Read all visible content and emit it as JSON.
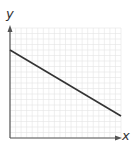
{
  "chart_data": {
    "type": "line",
    "title": "",
    "xlabel": "x",
    "ylabel": "y",
    "x": [
      0,
      20
    ],
    "series": [
      {
        "name": "line",
        "values": [
          16,
          4
        ]
      }
    ],
    "xlim": [
      0,
      20
    ],
    "ylim": [
      0,
      20
    ],
    "grid": true,
    "ticks_labeled": false
  },
  "labels": {
    "x": "x",
    "y": "y"
  },
  "colors": {
    "grid": "#e4e4e4",
    "axis": "#555555",
    "line": "#333333"
  }
}
